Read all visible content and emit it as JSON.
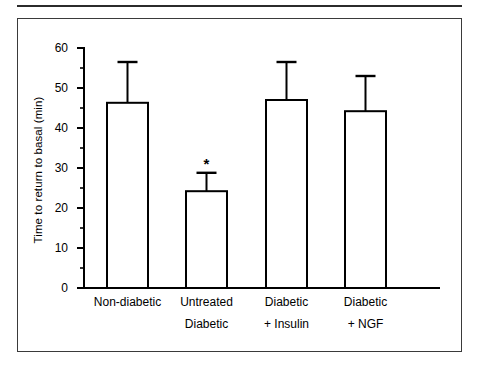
{
  "figure": {
    "frame_border_color": "#3a3a3a",
    "background_color": "#ffffff",
    "ink_color": "#000000"
  },
  "chart_data": {
    "type": "bar",
    "title": "",
    "subtitle": "",
    "xlabel": "",
    "ylabel": "Time to return to basal (min)",
    "categories": [
      "Non-diabetic",
      "Untreated Diabetic",
      "Diabetic + Insulin",
      "Diabetic + NGF"
    ],
    "category_label_lines": [
      [
        "Non-diabetic",
        ""
      ],
      [
        "Untreated",
        "Diabetic"
      ],
      [
        "Diabetic",
        "+ Insulin"
      ],
      [
        "Diabetic",
        "+ NGF"
      ]
    ],
    "values": [
      46.3,
      24.2,
      47.0,
      44.2
    ],
    "errors": [
      10.2,
      4.6,
      9.5,
      8.8
    ],
    "error_upper": [
      56.5,
      28.8,
      56.5,
      53.0
    ],
    "error_bar_type": "upper-only",
    "annotations": [
      {
        "category": "Untreated Diabetic",
        "text": "*",
        "meaning": "significant-difference"
      }
    ],
    "ylim": [
      0,
      60
    ],
    "ytick_values": [
      0,
      10,
      20,
      30,
      40,
      50,
      60
    ],
    "ytick_labels": [
      "0",
      "10",
      "20",
      "30",
      "40",
      "50",
      "60"
    ],
    "yminor_tick_values": [
      5,
      15,
      25,
      35,
      45,
      55
    ],
    "grid": false,
    "legend": false,
    "bar_fill": "#ffffff",
    "bar_edge": "#000000"
  }
}
